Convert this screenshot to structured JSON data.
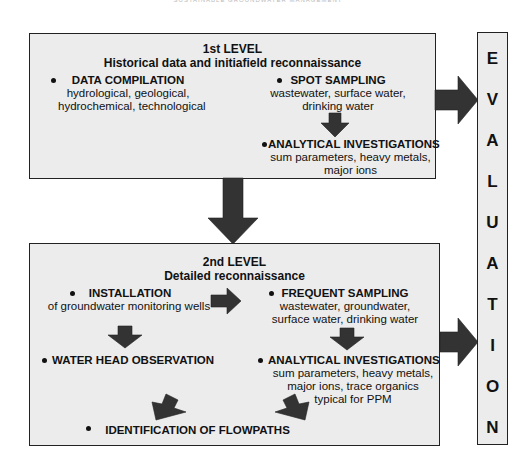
{
  "running_header": "SUSTAINABLE GROUNDWATER MANAGEMENT",
  "level1": {
    "heading": "1st LEVEL",
    "subheading": "Historical data and initiafield reconnaissance",
    "data_compilation": {
      "title": "DATA COMPILATION",
      "lines": [
        "hydrological, geological,",
        "hydrochemical, technological"
      ]
    },
    "spot_sampling": {
      "title": "SPOT SAMPLING",
      "lines": [
        "wastewater, surface water,",
        "drinking water"
      ]
    },
    "analytical": {
      "title": "ANALYTICAL INVESTIGATIONS",
      "lines": [
        "sum parameters, heavy metals,",
        "major ions"
      ]
    }
  },
  "level2": {
    "heading": "2nd LEVEL",
    "subheading": "Detailed reconnaissance",
    "installation": {
      "title": "INSTALLATION",
      "lines": [
        "of groundwater monitoring wells"
      ]
    },
    "frequent_sampling": {
      "title": "FREQUENT SAMPLING",
      "lines": [
        "wastewater, groundwater,",
        "surface water, drinking water"
      ]
    },
    "water_head": {
      "title": "WATER HEAD OBSERVATION"
    },
    "analytical": {
      "title": "ANALYTICAL INVESTIGATIONS",
      "lines": [
        "sum parameters, heavy metals,",
        "major ions, trace organics",
        "typical for PPM"
      ]
    },
    "flowpaths": {
      "title": "IDENTIFICATION OF FLOWPATHS"
    }
  },
  "evaluation": {
    "letters": [
      "E",
      "V",
      "A",
      "L",
      "U",
      "A",
      "T",
      "I",
      "O",
      "N"
    ]
  },
  "colors": {
    "box_fill": "#ececec",
    "border": "#222222",
    "arrow": "#333333"
  }
}
